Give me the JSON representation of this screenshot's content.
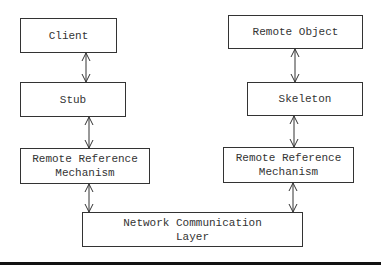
{
  "diagram": {
    "title": "",
    "nodes": {
      "client": {
        "label": "Client"
      },
      "stub": {
        "label": "Stub"
      },
      "rrm_left": {
        "line1": "Remote Reference",
        "line2": "Mechanism"
      },
      "remote_object": {
        "label": "Remote Object"
      },
      "skeleton": {
        "label": "Skeleton"
      },
      "rrm_right": {
        "line1": "Remote Reference",
        "line2": "Mechanism"
      },
      "network": {
        "line1": "Network Communication",
        "line2": "Layer"
      }
    },
    "edges": [
      {
        "from": "client",
        "to": "stub",
        "type": "bidirectional"
      },
      {
        "from": "stub",
        "to": "rrm_left",
        "type": "bidirectional"
      },
      {
        "from": "rrm_left",
        "to": "network",
        "type": "bidirectional"
      },
      {
        "from": "remote_object",
        "to": "skeleton",
        "type": "bidirectional"
      },
      {
        "from": "skeleton",
        "to": "rrm_right",
        "type": "bidirectional"
      },
      {
        "from": "rrm_right",
        "to": "network",
        "type": "bidirectional"
      }
    ],
    "colors": {
      "stroke": "#333333",
      "background": "#ffffff"
    }
  }
}
